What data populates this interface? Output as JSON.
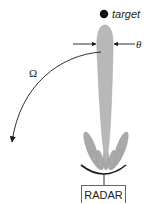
{
  "diagram": {
    "title": "",
    "labels": {
      "target": "target",
      "beamwidth": "θ",
      "scan_rate": "Ω",
      "radar": "RADAR"
    },
    "colors": {
      "beam_fill": "#b8b8b8",
      "sidelobe_fill": "#a9a9a9",
      "line": "#1a1a1a",
      "box_stroke": "#555555"
    },
    "elements": [
      {
        "id": "target",
        "type": "point",
        "label": "target"
      },
      {
        "id": "main-beam",
        "type": "lobe",
        "label": ""
      },
      {
        "id": "beamwidth-arrows",
        "type": "dimension",
        "label": "θ"
      },
      {
        "id": "scan-arc",
        "type": "curved-arrow",
        "label": "Ω"
      },
      {
        "id": "sidelobes",
        "type": "lobes",
        "label": ""
      },
      {
        "id": "antenna-dish",
        "type": "reflector",
        "label": ""
      },
      {
        "id": "radar-box",
        "type": "box",
        "label": "RADAR"
      }
    ]
  }
}
